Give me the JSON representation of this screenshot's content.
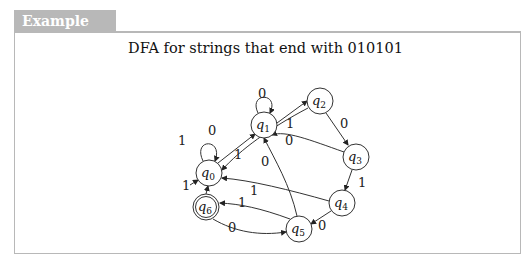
{
  "example": {
    "label": "Example 4.1"
  },
  "diagram": {
    "title": "DFA for strings that end with 010101",
    "start_state": "q0",
    "accept_states": [
      "q6"
    ],
    "states": [
      {
        "id": "q0",
        "name": "q",
        "sub": "0",
        "x": 209,
        "y": 173
      },
      {
        "id": "q1",
        "name": "q",
        "sub": "1",
        "x": 264,
        "y": 125
      },
      {
        "id": "q2",
        "name": "q",
        "sub": "2",
        "x": 320,
        "y": 101
      },
      {
        "id": "q3",
        "name": "q",
        "sub": "3",
        "x": 356,
        "y": 157
      },
      {
        "id": "q4",
        "name": "q",
        "sub": "4",
        "x": 342,
        "y": 203
      },
      {
        "id": "q5",
        "name": "q",
        "sub": "5",
        "x": 299,
        "y": 229
      },
      {
        "id": "q6",
        "name": "q",
        "sub": "6",
        "x": 206,
        "y": 207
      }
    ],
    "transitions": [
      {
        "from": "q0",
        "to": "q0",
        "symbol": "1"
      },
      {
        "from": "q0",
        "to": "q1",
        "symbol": "0"
      },
      {
        "from": "q1",
        "to": "q1",
        "symbol": "0"
      },
      {
        "from": "q1",
        "to": "q2",
        "symbol": "1"
      },
      {
        "from": "q2",
        "to": "q0",
        "symbol": "1"
      },
      {
        "from": "q2",
        "to": "q3",
        "symbol": "0"
      },
      {
        "from": "q3",
        "to": "q1",
        "symbol": "0"
      },
      {
        "from": "q3",
        "to": "q4",
        "symbol": "1"
      },
      {
        "from": "q4",
        "to": "q0",
        "symbol": "1"
      },
      {
        "from": "q4",
        "to": "q5",
        "symbol": "0"
      },
      {
        "from": "q5",
        "to": "q1",
        "symbol": "0"
      },
      {
        "from": "q5",
        "to": "q6",
        "symbol": "1"
      },
      {
        "from": "q6",
        "to": "q0",
        "symbol": "1"
      },
      {
        "from": "q6",
        "to": "q5",
        "symbol": "0"
      }
    ],
    "edge_labels": {
      "q0_self": "1",
      "q1_self": "0",
      "q0_q1": "0",
      "q1_q2": "1",
      "q2_q0": "1",
      "q2_q3": "0",
      "q3_q1": "0",
      "q3_q4": "1",
      "q4_q0": "1",
      "q4_q5": "0",
      "q5_q1": "0",
      "q5_q6": "1",
      "q6_q0": "1",
      "q6_q5": "0"
    }
  }
}
